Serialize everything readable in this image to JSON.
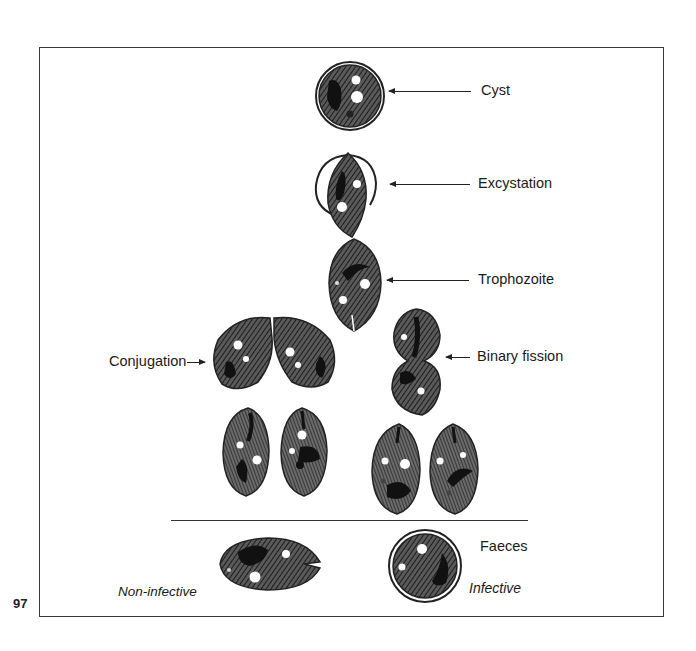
{
  "figure": {
    "page_number": "97",
    "stages": [
      {
        "id": "cyst",
        "label": "Cyst"
      },
      {
        "id": "excystation",
        "label": "Excystation"
      },
      {
        "id": "trophozoite",
        "label": "Trophozoite"
      },
      {
        "id": "conjugation",
        "label": "Conjugation"
      },
      {
        "id": "binary_fission",
        "label": "Binary fission"
      }
    ],
    "bottom": {
      "faeces": "Faeces",
      "non_infective": "Non-infective",
      "infective": "Infective"
    },
    "colors": {
      "ink": "#1a1a1a",
      "background": "#ffffff",
      "frame": "#3a3a3a"
    }
  }
}
